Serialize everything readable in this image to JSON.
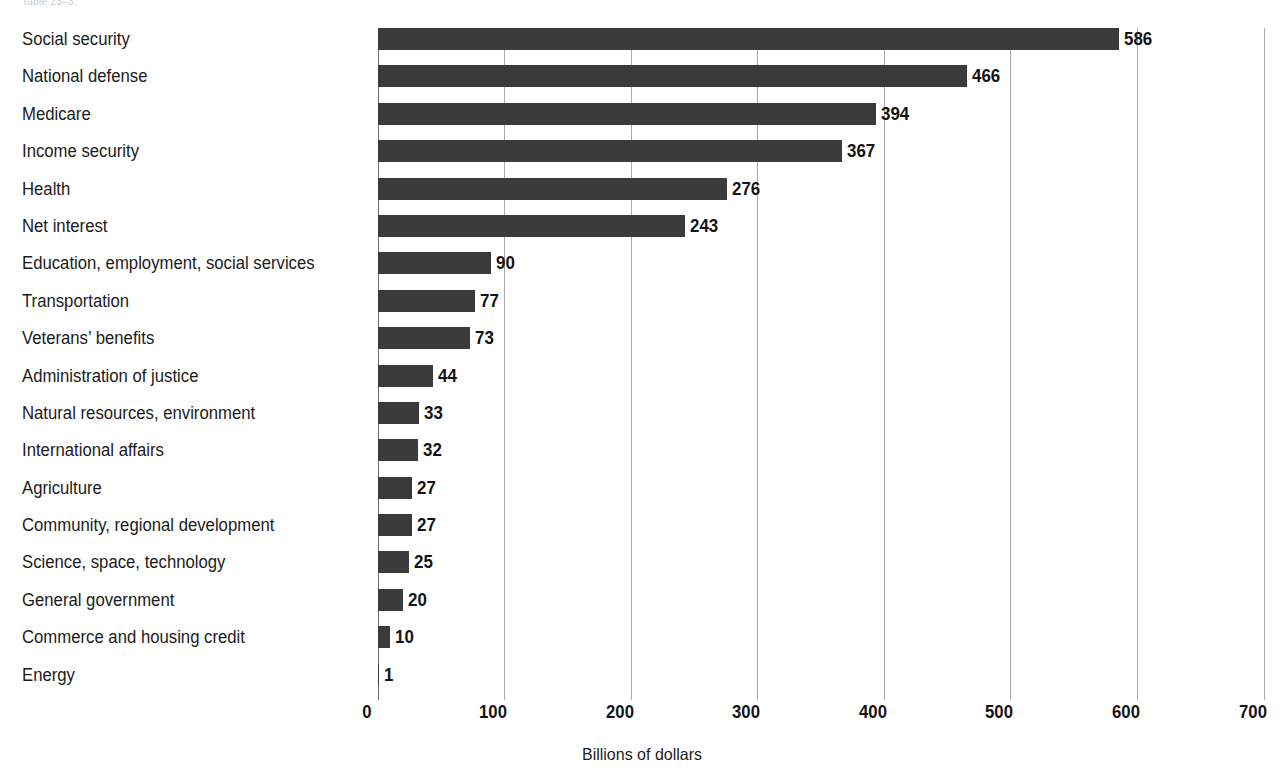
{
  "caption_remnant": "Table 23–3.",
  "chart_data": {
    "type": "bar",
    "orientation": "horizontal",
    "title": "",
    "subtitle": "",
    "xlabel": "Billions of dollars",
    "ylabel": "",
    "xlim": [
      0,
      700
    ],
    "xticks": [
      0,
      100,
      200,
      300,
      400,
      500,
      600,
      700
    ],
    "xtick_labels": [
      "0",
      "100",
      "200",
      "300",
      "400",
      "500",
      "600",
      "700"
    ],
    "grid": true,
    "legend": "none",
    "bar_color": "#3b3b3b",
    "categories": [
      "Social security",
      "National defense",
      "Medicare",
      "Income security",
      "Health",
      "Net interest",
      "Education, employment, social services",
      "Transportation",
      "Veterans’ benefits",
      "Administration of justice",
      "Natural resources, environment",
      "International affairs",
      "Agriculture",
      "Community, regional development",
      "Science, space, technology",
      "General government",
      "Commerce and housing credit",
      "Energy"
    ],
    "values": [
      586,
      466,
      394,
      367,
      276,
      243,
      90,
      77,
      73,
      44,
      33,
      32,
      27,
      27,
      25,
      20,
      10,
      1
    ],
    "value_labels": [
      "586",
      "466",
      "394",
      "367",
      "276",
      "243",
      "90",
      "77",
      "73",
      "44",
      "33",
      "32",
      "27",
      "27",
      "25",
      "20",
      "10",
      "1"
    ]
  }
}
